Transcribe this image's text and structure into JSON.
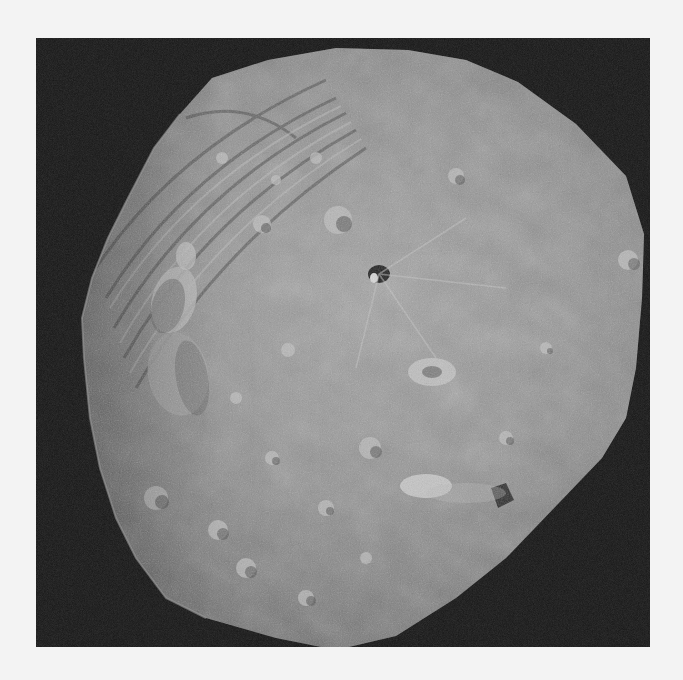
{
  "image": {
    "subject": "Cratered asteroid photographed against black space",
    "alt": "Grayscale image of a large irregular asteroid with many craters, grooves near the upper-left limb, and a bright-rayed crater near the center",
    "colors": {
      "page_background": "#f3f3f3",
      "space_background": "#151515",
      "surface_mid": "#8a8a8a",
      "surface_light": "#b4b4b4",
      "surface_dark": "#5a5a5a"
    },
    "features": [
      {
        "name": "grooves",
        "region": "upper-left limb"
      },
      {
        "name": "large-double-crater",
        "region": "left side"
      },
      {
        "name": "dark-crater",
        "region": "upper center"
      },
      {
        "name": "bright-ray-crater",
        "region": "center right"
      },
      {
        "name": "bright-ejecta-patch",
        "region": "lower right"
      }
    ]
  }
}
